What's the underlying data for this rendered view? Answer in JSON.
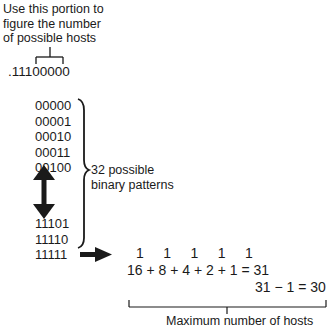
{
  "top_caption": {
    "line1": "Use this portion to",
    "line2": "figure the number",
    "line3": "of possible hosts"
  },
  "subnet_mask_octet": ".11100000",
  "patterns_top": [
    "00000",
    "00001",
    "00010",
    "00011",
    "00100"
  ],
  "patterns_bottom": [
    "11101",
    "11110",
    "11111"
  ],
  "brace_label": {
    "line1": "32 possible",
    "line2": "binary patterns"
  },
  "bit_row": "1     1     1     1     1",
  "sum_row": "16 + 8 + 4 + 2 + 1 = 31",
  "subtract_row": "31 − 1 = 30",
  "bottom_caption": "Maximum number of hosts",
  "colors": {
    "ink": "#1a1a1a",
    "background": "#ffffff"
  }
}
